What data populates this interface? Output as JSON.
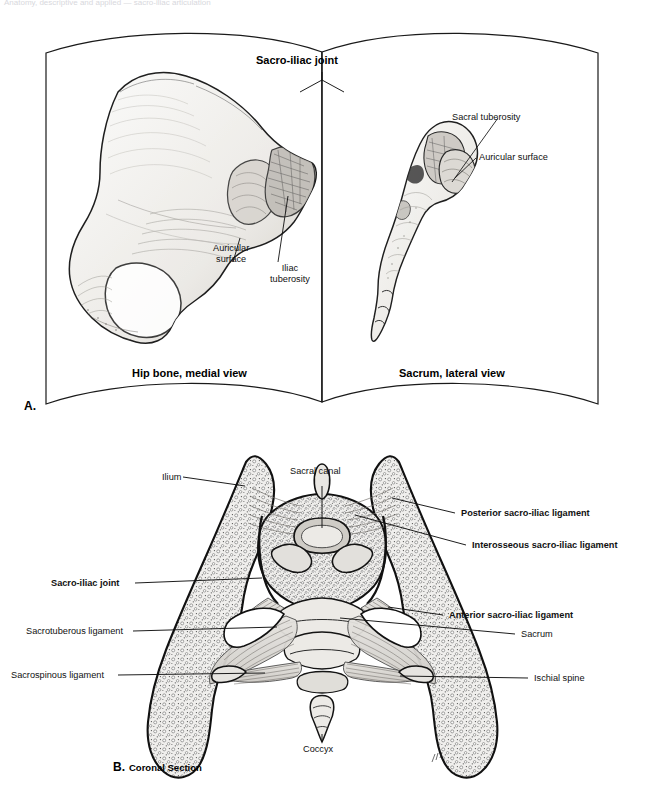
{
  "figure": {
    "faint_header": "Anatomy, descriptive and applied — sacro-iliac articulation",
    "panel_a": {
      "mark": "A.",
      "title": "Sacro-iliac joint",
      "left_caption": "Hip bone, medial view",
      "right_caption": "Sacrum, lateral view",
      "labels": [
        {
          "id": "auricular-surface-hip",
          "text": "Auricular\nsurface",
          "bold": false
        },
        {
          "id": "iliac-tuberosity",
          "text": "Iliac\ntuberosity",
          "bold": false
        },
        {
          "id": "sacral-tuberosity",
          "text": "Sacral tuberosity",
          "bold": false
        },
        {
          "id": "auricular-surface-sacrum",
          "text": "Auricular surface",
          "bold": false
        }
      ]
    },
    "panel_b": {
      "mark": "B.",
      "caption": "Coronal Section",
      "labels": [
        {
          "id": "ilium",
          "text": "Ilium",
          "bold": false
        },
        {
          "id": "sacral-canal",
          "text": "Sacral canal",
          "bold": false
        },
        {
          "id": "posterior-sacro-iliac-ligament",
          "text": "Posterior sacro-iliac ligament",
          "bold": true
        },
        {
          "id": "interosseous-sacro-iliac-ligament",
          "text": "Interosseous sacro-iliac ligament",
          "bold": true
        },
        {
          "id": "sacro-iliac-joint",
          "text": "Sacro-iliac joint",
          "bold": true
        },
        {
          "id": "anterior-sacro-iliac-ligament",
          "text": "Anterior sacro-iliac ligament",
          "bold": true
        },
        {
          "id": "sacrotuberous-ligament",
          "text": "Sacrotuberous ligament",
          "bold": false
        },
        {
          "id": "sacrum",
          "text": "Sacrum",
          "bold": false
        },
        {
          "id": "sacrospinous-ligament",
          "text": "Sacrospinous ligament",
          "bold": false
        },
        {
          "id": "ischial-spine",
          "text": "Ischial spine",
          "bold": false
        },
        {
          "id": "coccyx",
          "text": "Coccyx",
          "bold": false
        }
      ]
    },
    "colors": {
      "ink": "#000000",
      "bone_fill": "#f2f1ef",
      "bone_shade": "#d9d7d3",
      "cancellous": "#e9e8e5",
      "ligament": "#dedcd8",
      "paper": "#ffffff"
    }
  }
}
